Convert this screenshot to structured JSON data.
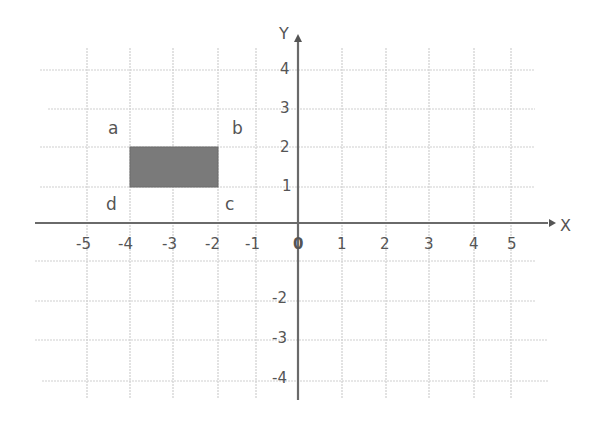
{
  "diagram": {
    "type": "coordinate-grid",
    "x_axis": {
      "label": "X",
      "ticks": [
        "-5",
        "-4",
        "-3",
        "-2",
        "-1",
        "0",
        "1",
        "2",
        "3",
        "4",
        "5"
      ]
    },
    "y_axis": {
      "label": "Y",
      "ticks_positive": [
        "1",
        "2",
        "3",
        "4"
      ],
      "ticks_negative": [
        "-2",
        "-3",
        "-4"
      ]
    },
    "rectangle": {
      "fill": "#7a7a7a",
      "corners": [
        {
          "name": "a",
          "x": -4,
          "y": 2
        },
        {
          "name": "b",
          "x": -2,
          "y": 2
        },
        {
          "name": "c",
          "x": -2,
          "y": 1
        },
        {
          "name": "d",
          "x": -4,
          "y": 1
        }
      ]
    },
    "colors": {
      "grid": "#cccccc",
      "axis": "#666666",
      "text": "#555555"
    }
  }
}
